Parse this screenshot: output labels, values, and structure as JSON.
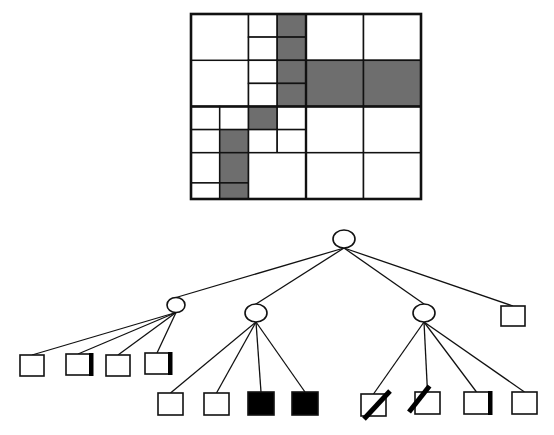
{
  "figure": {
    "type": "quadtree-decomposition-diagram",
    "caption": "",
    "colors": {
      "occupied_fill": "#6e6e6e",
      "empty_fill": "#ffffff",
      "full_leaf_fill": "#000000",
      "stroke": "#111111",
      "background": "#ffffff"
    }
  },
  "grid": {
    "name": "quadtree-image-decomposition",
    "x": 191,
    "y": 14,
    "width": 230,
    "height": 185,
    "outer_border_width": 2.6,
    "cells": [
      {
        "id": "q1-nw",
        "x": 0,
        "y": 0,
        "w": 57.5,
        "h": 92.5,
        "state": "empty"
      },
      {
        "id": "q1-ne-nw",
        "x": 57.5,
        "y": 0,
        "w": 28.7,
        "h": 23.1,
        "state": "empty"
      },
      {
        "id": "q1-ne-ne",
        "x": 86.2,
        "y": 0,
        "w": 28.8,
        "h": 23.1,
        "state": "occupied"
      },
      {
        "id": "q1-ne-sw",
        "x": 57.5,
        "y": 23.1,
        "w": 28.7,
        "h": 23.2,
        "state": "empty"
      },
      {
        "id": "q1-ne-se",
        "x": 86.2,
        "y": 23.1,
        "w": 28.8,
        "h": 23.2,
        "state": "occupied"
      },
      {
        "id": "q1-sw",
        "x": 0,
        "y": 46.3,
        "w": 57.5,
        "h": 46.2,
        "state": "empty"
      },
      {
        "id": "q1-se-nw",
        "x": 57.5,
        "y": 46.3,
        "w": 28.7,
        "h": 23.1,
        "state": "empty"
      },
      {
        "id": "q1-se-ne",
        "x": 86.2,
        "y": 46.3,
        "w": 28.8,
        "h": 23.1,
        "state": "occupied"
      },
      {
        "id": "q1-se-sw",
        "x": 57.5,
        "y": 69.4,
        "w": 28.7,
        "h": 23.1,
        "state": "empty"
      },
      {
        "id": "q1-se-se",
        "x": 86.2,
        "y": 69.4,
        "w": 28.8,
        "h": 23.1,
        "state": "occupied"
      },
      {
        "id": "q2-nw",
        "x": 115,
        "y": 0,
        "w": 57.5,
        "h": 46.3,
        "state": "empty"
      },
      {
        "id": "q2-ne",
        "x": 172.5,
        "y": 0,
        "w": 57.5,
        "h": 46.3,
        "state": "empty"
      },
      {
        "id": "q2-sw",
        "x": 115,
        "y": 46.3,
        "w": 57.5,
        "h": 46.2,
        "state": "occupied"
      },
      {
        "id": "q2-se",
        "x": 172.5,
        "y": 46.3,
        "w": 57.5,
        "h": 46.2,
        "state": "occupied"
      },
      {
        "id": "q3-nw-nw",
        "x": 0,
        "y": 92.5,
        "w": 28.7,
        "h": 23.1,
        "state": "empty"
      },
      {
        "id": "q3-nw-ne",
        "x": 28.7,
        "y": 92.5,
        "w": 28.8,
        "h": 23.1,
        "state": "empty"
      },
      {
        "id": "q3-nw-sw",
        "x": 0,
        "y": 115.6,
        "w": 28.7,
        "h": 23.1,
        "state": "empty"
      },
      {
        "id": "q3-nw-se",
        "x": 28.7,
        "y": 115.6,
        "w": 28.8,
        "h": 23.1,
        "state": "occupied"
      },
      {
        "id": "q3-ne-nw",
        "x": 57.5,
        "y": 92.5,
        "w": 28.7,
        "h": 23.1,
        "state": "occupied"
      },
      {
        "id": "q3-ne-ne",
        "x": 86.2,
        "y": 92.5,
        "w": 28.8,
        "h": 23.1,
        "state": "empty"
      },
      {
        "id": "q3-ne-sw",
        "x": 57.5,
        "y": 115.6,
        "w": 28.7,
        "h": 23.1,
        "state": "empty"
      },
      {
        "id": "q3-ne-se",
        "x": 86.2,
        "y": 115.6,
        "w": 28.8,
        "h": 23.1,
        "state": "empty"
      },
      {
        "id": "q3-sw-nw",
        "x": 0,
        "y": 138.7,
        "w": 28.7,
        "h": 30.2,
        "state": "empty"
      },
      {
        "id": "q3-sw-ne",
        "x": 28.7,
        "y": 138.7,
        "w": 28.8,
        "h": 30.2,
        "state": "occupied"
      },
      {
        "id": "q3-sw-sw",
        "x": 0,
        "y": 168.9,
        "w": 28.7,
        "h": 16.1,
        "state": "empty"
      },
      {
        "id": "q3-sw-se",
        "x": 28.7,
        "y": 168.9,
        "w": 28.8,
        "h": 16.1,
        "state": "occupied"
      },
      {
        "id": "q3-se",
        "x": 57.5,
        "y": 138.7,
        "w": 57.5,
        "h": 46.3,
        "state": "empty"
      },
      {
        "id": "q4-nw",
        "x": 115,
        "y": 92.5,
        "w": 57.5,
        "h": 46.2,
        "state": "empty"
      },
      {
        "id": "q4-ne",
        "x": 172.5,
        "y": 92.5,
        "w": 57.5,
        "h": 46.2,
        "state": "empty"
      },
      {
        "id": "q4-sw",
        "x": 115,
        "y": 138.7,
        "w": 57.5,
        "h": 46.3,
        "state": "empty"
      },
      {
        "id": "q4-se",
        "x": 172.5,
        "y": 138.7,
        "w": 57.5,
        "h": 46.3,
        "state": "empty"
      }
    ]
  },
  "tree": {
    "name": "quadtree-structure",
    "node_shape_internal": "ellipse",
    "node_shape_leaf": "square",
    "root": {
      "id": "root",
      "x": 344,
      "y": 239,
      "rx": 11,
      "ry": 9,
      "kind": "internal"
    },
    "internal_nodes": [
      {
        "id": "n-nw",
        "x": 176,
        "y": 305,
        "rx": 9,
        "ry": 7.5,
        "kind": "internal",
        "parent": "root"
      },
      {
        "id": "n-ne",
        "x": 256,
        "y": 313,
        "rx": 11,
        "ry": 9,
        "kind": "internal",
        "parent": "root"
      },
      {
        "id": "n-sw",
        "x": 424,
        "y": 313,
        "rx": 11,
        "ry": 9,
        "kind": "internal",
        "parent": "root"
      }
    ],
    "leaves": [
      {
        "id": "l-root-4",
        "x": 501,
        "y": 306,
        "w": 24,
        "h": 20,
        "state": "empty",
        "parent": "root"
      },
      {
        "id": "l-nw-1",
        "x": 20,
        "y": 355,
        "w": 24,
        "h": 21,
        "state": "empty",
        "parent": "n-nw"
      },
      {
        "id": "l-nw-2",
        "x": 66,
        "y": 354,
        "w": 24,
        "h": 21,
        "state": "bar-right",
        "parent": "n-nw"
      },
      {
        "id": "l-nw-3",
        "x": 106,
        "y": 355,
        "w": 24,
        "h": 21,
        "state": "empty",
        "parent": "n-nw"
      },
      {
        "id": "l-nw-4",
        "x": 145,
        "y": 353,
        "w": 24,
        "h": 21,
        "state": "bar-right",
        "parent": "n-nw"
      },
      {
        "id": "l-ne-1",
        "x": 158,
        "y": 393,
        "w": 25,
        "h": 22,
        "state": "empty",
        "parent": "n-ne"
      },
      {
        "id": "l-ne-2",
        "x": 204,
        "y": 393,
        "w": 25,
        "h": 22,
        "state": "empty",
        "parent": "n-ne"
      },
      {
        "id": "l-ne-3",
        "x": 248,
        "y": 392,
        "w": 26,
        "h": 23,
        "state": "full",
        "parent": "n-ne"
      },
      {
        "id": "l-ne-4",
        "x": 292,
        "y": 392,
        "w": 26,
        "h": 23,
        "state": "full",
        "parent": "n-ne"
      },
      {
        "id": "l-sw-1",
        "x": 361,
        "y": 394,
        "w": 25,
        "h": 22,
        "state": "slash-br",
        "parent": "n-sw"
      },
      {
        "id": "l-sw-2",
        "x": 415,
        "y": 392,
        "w": 25,
        "h": 22,
        "state": "slash-tl",
        "parent": "n-sw"
      },
      {
        "id": "l-sw-3",
        "x": 464,
        "y": 392,
        "w": 25,
        "h": 22,
        "state": "bar-right",
        "parent": "n-sw"
      },
      {
        "id": "l-sw-4",
        "x": 512,
        "y": 392,
        "w": 25,
        "h": 22,
        "state": "empty",
        "parent": "n-sw"
      }
    ]
  }
}
